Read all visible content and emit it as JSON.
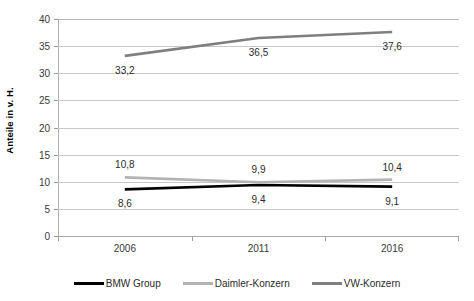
{
  "chart_data": {
    "type": "line",
    "title": "",
    "subtitle": "",
    "xlabel": "",
    "ylabel": "Anteile in v. H.",
    "categories": [
      "2006",
      "2011",
      "2016"
    ],
    "series": [
      {
        "name": "BMW Group",
        "color": "#000000",
        "values": [
          8.6,
          9.4,
          9.1
        ],
        "labels": [
          "8,6",
          "9,4",
          "9,1"
        ],
        "label_position": "below"
      },
      {
        "name": "Daimler-Konzern",
        "color": "#b3b3b3",
        "values": [
          10.8,
          9.9,
          10.4
        ],
        "labels": [
          "10,8",
          "9,9",
          "10,4"
        ],
        "label_position": "above"
      },
      {
        "name": "VW-Konzern",
        "color": "#7f7f7f",
        "values": [
          33.2,
          36.5,
          37.6
        ],
        "labels": [
          "33,2",
          "36,5",
          "37,6"
        ],
        "label_position": "below"
      }
    ],
    "ylim": [
      0,
      40
    ],
    "ytick_step": 5,
    "yticks": [
      "40",
      "35",
      "30",
      "25",
      "20",
      "15",
      "10",
      "5",
      "0"
    ],
    "ytick_values": [
      40,
      35,
      30,
      25,
      20,
      15,
      10,
      5,
      0
    ],
    "grid": true,
    "grid_axis": "y",
    "legend_position": "bottom",
    "legend": [
      "BMW Group",
      "Daimler-Konzern",
      "VW-Konzern"
    ]
  },
  "colors": {
    "background": "#ffffff",
    "gridline": "#c8c8c8",
    "axis": "#a8a8a8",
    "text": "#2b2b2b",
    "bmw": "#000000",
    "daimler": "#b3b3b3",
    "vw": "#7f7f7f"
  }
}
